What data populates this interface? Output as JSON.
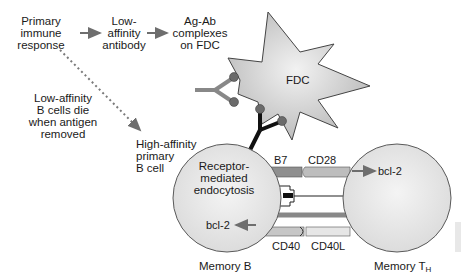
{
  "flow": {
    "step1": [
      "Primary",
      "immune",
      "response"
    ],
    "step2": [
      "Low-",
      "affinity",
      "antibody"
    ],
    "step3": [
      "Ag-Ab",
      "complexes",
      "on FDC"
    ]
  },
  "side_note": [
    "Low-affinity",
    "B cells die",
    "when antigen",
    "removed"
  ],
  "high_affinity": [
    "High-affinity",
    "primary",
    "B cell"
  ],
  "fdc": {
    "label": "FDC"
  },
  "memory_b": {
    "inner": [
      "Receptor-",
      "mediated",
      "endocytosis"
    ],
    "bcl": "bcl-2",
    "caption": "Memory B"
  },
  "memory_th": {
    "bcl": "bcl-2",
    "caption_main": "Memory T",
    "caption_sub": "H"
  },
  "receptors": {
    "b7": "B7",
    "cd28": "CD28",
    "cd40": "CD40",
    "cd40l": "CD40L"
  },
  "colors": {
    "cell_fill": "#e6e6e6",
    "cell_stroke": "#5a5a5a",
    "arrow": "#6e6e6e",
    "antibody_dark": "#111111",
    "antibody_gray": "#888888",
    "antigen_dot": "#6b6b6b",
    "fdc_fill": "#c8c8c8"
  }
}
